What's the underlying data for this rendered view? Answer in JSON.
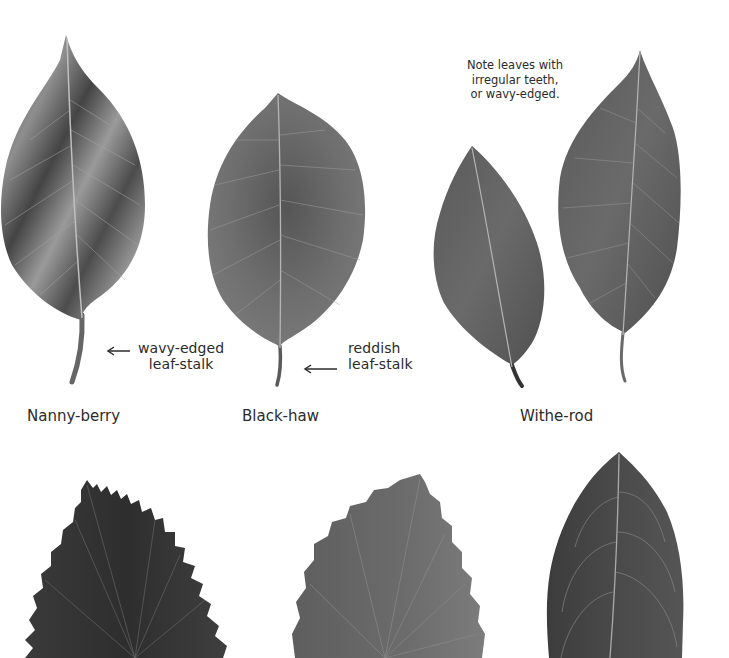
{
  "top_row": {
    "species": [
      {
        "name": "Nanny-berry",
        "annotation": [
          "wavy-edged",
          "leaf-stalk"
        ]
      },
      {
        "name": "Black-haw",
        "annotation": [
          "reddish",
          "leaf-stalk"
        ]
      },
      {
        "name": "Withe-rod",
        "note": [
          "Note leaves with",
          "irregular teeth,",
          "or wavy-edged."
        ]
      }
    ]
  },
  "bottom_row": {
    "leaves": [
      "sharp-toothed leaf",
      "coarse-toothed leaf",
      "smooth-edged leaf"
    ]
  },
  "colors": {
    "background": "#ffffff",
    "text": "#2b2b2b",
    "leaf_dark": "#3a3a3a",
    "leaf_mid": "#6a6a6a",
    "leaf_light": "#9a9a9a",
    "vein": "#b8b8b8"
  }
}
